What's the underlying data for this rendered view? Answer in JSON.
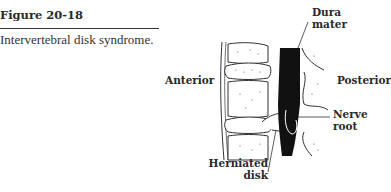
{
  "figure": {
    "number": "Figure 20-18",
    "caption": "Intervertebral disk syndrome."
  },
  "illustration": {
    "subject": "spine-lateral-view-herniated-disk",
    "labels": {
      "dura_mater_line1": "Dura",
      "dura_mater_line2": "mater",
      "anterior": "Anterior",
      "posterior": "Posterior",
      "nerve_root_line1": "Nerve",
      "nerve_root_line2": "root",
      "herniated_disk_line1": "Herniated",
      "herniated_disk_line2": "disk"
    }
  }
}
